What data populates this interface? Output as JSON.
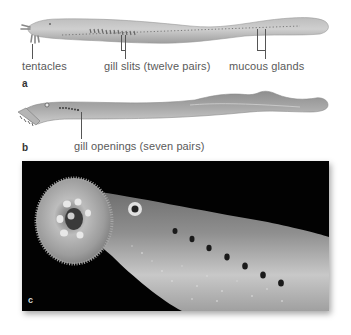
{
  "figure": {
    "panel_a": {
      "letter": "a",
      "subject": "hagfish illustration",
      "labels": {
        "tentacles": "tentacles",
        "gill_slits": "gill slits (twelve pairs)",
        "mucous_glands": "mucous glands"
      }
    },
    "panel_b": {
      "letter": "b",
      "subject": "lamprey illustration",
      "labels": {
        "gill_openings": "gill openings (seven pairs)"
      }
    },
    "panel_c": {
      "letter": "c",
      "subject": "photograph of lamprey oral disk and gill openings"
    },
    "colors": {
      "background": "#ffffff",
      "body_light": "#c8c8c8",
      "body_dark": "#8a8a8a",
      "photo_background": "#020202",
      "label_text": "#5a5a5a"
    }
  }
}
